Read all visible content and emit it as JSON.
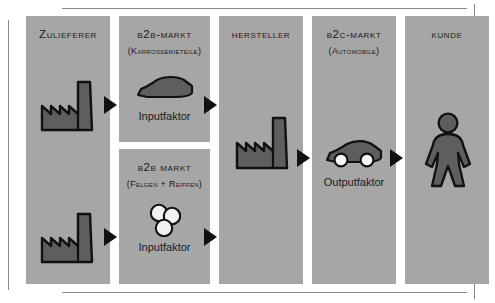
{
  "diagram": {
    "title_semantic": "value-chain-b2b-b2c",
    "colors": {
      "panel_fill": "#a6a6a6",
      "icon_fill": "#5e5e5e",
      "icon_stroke": "#111111",
      "arrow": "#111111",
      "text": "#1a1a1a",
      "rule": "#8a8a8a",
      "wheel_fill": "#f2f2f2"
    },
    "columns": [
      {
        "key": "zulieferer",
        "panels": [
          {
            "key": "zulieferer-panel",
            "title": "Zulieferer",
            "subtitle": "",
            "caption": "",
            "icons": [
              "factory-icon",
              "factory-icon"
            ]
          }
        ]
      },
      {
        "key": "b2b",
        "panels": [
          {
            "key": "b2b-karosserie-panel",
            "title": "B2B-Markt",
            "subtitle": "(Karrosserieteile)",
            "caption": "Inputfaktor",
            "icons": [
              "car-body-icon"
            ]
          },
          {
            "key": "b2b-felgen-panel",
            "title": "B2B Markt",
            "subtitle": "(Felgen + Reiffen)",
            "caption": "Inputfaktor",
            "icons": [
              "wheels-icon"
            ]
          }
        ]
      },
      {
        "key": "hersteller",
        "panels": [
          {
            "key": "hersteller-panel",
            "title": "Hersteller",
            "subtitle": "",
            "caption": "",
            "icons": [
              "factory-icon"
            ]
          }
        ]
      },
      {
        "key": "b2c",
        "panels": [
          {
            "key": "b2c-panel",
            "title": "B2C-Markt",
            "subtitle": "(Automobile)",
            "caption": "Outputfaktor",
            "icons": [
              "car-icon"
            ]
          }
        ]
      },
      {
        "key": "kunde",
        "panels": [
          {
            "key": "kunde-panel",
            "title": "Kunde",
            "subtitle": "",
            "caption": "",
            "icons": [
              "person-icon"
            ]
          }
        ]
      }
    ],
    "labels": {
      "zulieferer": "Zulieferer",
      "b2b_markt_karosserie": "B2B-Markt",
      "b2b_karosserie_sub": "(Karrosserieteile)",
      "b2b_markt_felgen": "B2B Markt",
      "b2b_felgen_sub": "(Felgen + Reiffen)",
      "hersteller": "Hersteller",
      "b2c_markt": "B2C-Markt",
      "b2c_sub": "(Automobile)",
      "kunde": "Kunde",
      "inputfaktor_top": "Inputfaktor",
      "inputfaktor_bottom": "Inputfaktor",
      "outputfaktor": "Outputfaktor"
    },
    "arrows": [
      {
        "key": "arrow-zulieferer-to-b2b-top",
        "from": "zulieferer",
        "to": "b2b-karosserie"
      },
      {
        "key": "arrow-b2b-top-to-hersteller",
        "from": "b2b-karosserie",
        "to": "hersteller"
      },
      {
        "key": "arrow-zulieferer-to-b2b-bottom",
        "from": "zulieferer",
        "to": "b2b-felgen"
      },
      {
        "key": "arrow-b2b-bottom-to-hersteller",
        "from": "b2b-felgen",
        "to": "hersteller"
      },
      {
        "key": "arrow-hersteller-to-b2c",
        "from": "hersteller",
        "to": "b2c"
      },
      {
        "key": "arrow-b2c-to-kunde",
        "from": "b2c",
        "to": "kunde"
      }
    ]
  }
}
